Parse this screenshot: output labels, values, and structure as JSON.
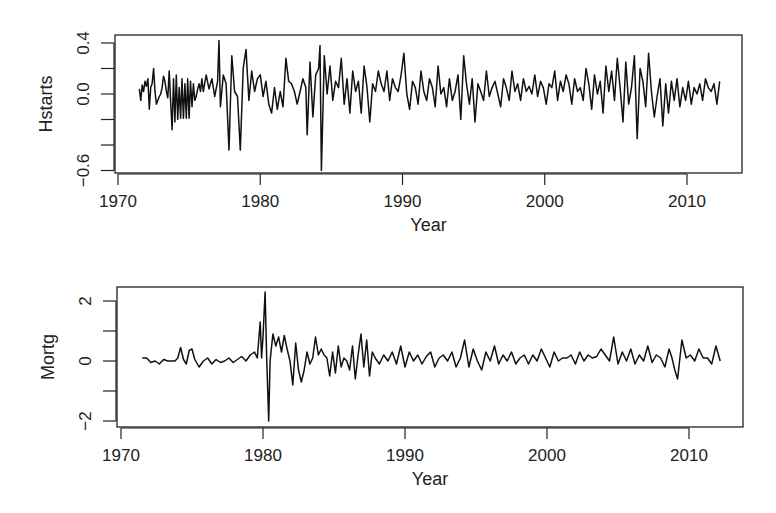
{
  "chart_data": [
    {
      "type": "line",
      "title": "",
      "xlabel": "Year",
      "ylabel": "Hstarts",
      "xlim": [
        1970,
        2013
      ],
      "ylim": [
        -0.6,
        0.4
      ],
      "x_ticks": [
        1970,
        1980,
        1990,
        2000,
        2010
      ],
      "x_tick_labels": [
        "1970",
        "1980",
        "1990",
        "2000",
        "2010"
      ],
      "y_ticks": [
        0.4,
        0.2,
        0.0,
        -0.2,
        -0.4,
        -0.6
      ],
      "y_tick_labels": [
        "0.4",
        "",
        "0.0",
        "",
        "",
        "-0.6"
      ],
      "grid": false,
      "legend": null,
      "frame": {
        "left": 115,
        "right": 742,
        "top": 35,
        "bottom": 173
      },
      "axis_px": {
        "x0": 118,
        "x1": 687,
        "xv0": 1970,
        "xv1": 2010,
        "y0": 94,
        "y1": 43,
        "yv0": 0.0,
        "yv1": 0.4
      },
      "series": [
        {
          "name": "Hstarts",
          "x": [
            1971.5,
            1971.6,
            1971.7,
            1971.8,
            1971.9,
            1972.0,
            1972.1,
            1972.2,
            1972.3,
            1972.4,
            1972.5,
            1972.6,
            1972.7,
            1972.8,
            1972.9,
            1973.0,
            1973.1,
            1973.2,
            1973.3,
            1973.4,
            1973.5,
            1973.6,
            1973.7,
            1973.8,
            1973.9,
            1974.0,
            1974.1,
            1974.2,
            1974.3,
            1974.4,
            1974.5,
            1974.6,
            1974.7,
            1974.8,
            1974.9,
            1975.0,
            1975.1,
            1975.2,
            1975.3,
            1975.4,
            1975.5,
            1975.6,
            1975.7,
            1975.8,
            1975.9,
            1976.0,
            1976.2,
            1976.4,
            1976.6,
            1976.8,
            1977.0,
            1977.1,
            1977.2,
            1977.4,
            1977.6,
            1977.8,
            1978.0,
            1978.2,
            1978.4,
            1978.6,
            1978.8,
            1979.0,
            1979.2,
            1979.4,
            1979.6,
            1979.8,
            1980.0,
            1980.2,
            1980.4,
            1980.6,
            1980.8,
            1981.0,
            1981.2,
            1981.4,
            1981.6,
            1981.8,
            1982.0,
            1982.2,
            1982.4,
            1982.6,
            1982.8,
            1983.0,
            1983.2,
            1983.3,
            1983.5,
            1983.7,
            1983.9,
            1984.1,
            1984.2,
            1984.3,
            1984.5,
            1984.7,
            1984.9,
            1985.1,
            1985.3,
            1985.5,
            1985.7,
            1985.9,
            1986.1,
            1986.3,
            1986.5,
            1986.7,
            1986.9,
            1987.1,
            1987.3,
            1987.5,
            1987.7,
            1987.9,
            1988.1,
            1988.3,
            1988.5,
            1988.7,
            1988.9,
            1989.1,
            1989.3,
            1989.5,
            1989.7,
            1989.9,
            1990.1,
            1990.3,
            1990.5,
            1990.7,
            1990.9,
            1991.1,
            1991.3,
            1991.5,
            1991.7,
            1991.9,
            1992.1,
            1992.3,
            1992.5,
            1992.7,
            1992.9,
            1993.1,
            1993.3,
            1993.5,
            1993.7,
            1993.9,
            1994.1,
            1994.3,
            1994.5,
            1994.7,
            1994.9,
            1995.1,
            1995.3,
            1995.5,
            1995.7,
            1995.9,
            1996.1,
            1996.3,
            1996.5,
            1996.7,
            1996.9,
            1997.1,
            1997.3,
            1997.5,
            1997.7,
            1997.9,
            1998.1,
            1998.3,
            1998.5,
            1998.7,
            1998.9,
            1999.1,
            1999.3,
            1999.5,
            1999.7,
            1999.9,
            2000.1,
            2000.3,
            2000.5,
            2000.7,
            2000.9,
            2001.1,
            2001.3,
            2001.5,
            2001.7,
            2001.9,
            2002.1,
            2002.3,
            2002.5,
            2002.7,
            2002.9,
            2003.1,
            2003.3,
            2003.5,
            2003.7,
            2003.9,
            2004.1,
            2004.3,
            2004.5,
            2004.7,
            2004.9,
            2005.1,
            2005.3,
            2005.5,
            2005.7,
            2005.9,
            2006.1,
            2006.3,
            2006.5,
            2006.7,
            2006.9,
            2007.1,
            2007.3,
            2007.5,
            2007.7,
            2007.9,
            2008.1,
            2008.3,
            2008.5,
            2008.7,
            2008.9,
            2009.1,
            2009.3,
            2009.5,
            2009.7,
            2009.9,
            2010.1,
            2010.3,
            2010.5,
            2010.7,
            2010.9,
            2011.1,
            2011.3,
            2011.5,
            2011.7,
            2011.9,
            2012.1,
            2012.3
          ],
          "values": [
            0.04,
            -0.05,
            0.07,
            0.02,
            0.1,
            0.06,
            0.12,
            -0.12,
            0.05,
            0.08,
            0.2,
            0.02,
            -0.08,
            -0.05,
            -0.02,
            0.0,
            0.05,
            0.14,
            0.1,
            0.02,
            -0.03,
            0.18,
            -0.05,
            -0.28,
            0.12,
            -0.22,
            0.15,
            -0.2,
            0.05,
            -0.19,
            0.12,
            -0.19,
            0.08,
            -0.19,
            0.12,
            -0.19,
            0.1,
            -0.1,
            0.08,
            -0.05,
            -0.02,
            0.04,
            0.08,
            0.02,
            0.12,
            0.02,
            0.15,
            0.04,
            0.12,
            -0.02,
            0.1,
            0.42,
            -0.1,
            0.15,
            0.08,
            -0.44,
            0.3,
            0.02,
            -0.02,
            -0.44,
            0.2,
            0.35,
            -0.05,
            0.18,
            0.02,
            0.12,
            0.15,
            -0.02,
            0.1,
            -0.08,
            -0.15,
            0.05,
            -0.12,
            0.02,
            -0.1,
            0.28,
            0.1,
            0.08,
            0.02,
            -0.08,
            0.02,
            0.12,
            0.05,
            -0.32,
            0.25,
            -0.18,
            0.15,
            0.2,
            0.38,
            -0.6,
            0.3,
            0.0,
            0.22,
            -0.05,
            0.1,
            0.05,
            0.28,
            -0.08,
            0.12,
            -0.15,
            0.18,
            0.02,
            0.1,
            -0.15,
            0.22,
            0.06,
            -0.22,
            0.08,
            0.02,
            0.18,
            0.08,
            0.02,
            0.18,
            -0.05,
            0.12,
            0.05,
            0.02,
            0.15,
            0.32,
            0.0,
            -0.12,
            0.1,
            0.05,
            -0.08,
            0.18,
            0.02,
            -0.05,
            0.12,
            0.05,
            -0.1,
            0.22,
            0.0,
            0.05,
            -0.1,
            0.12,
            -0.05,
            0.02,
            0.15,
            -0.2,
            0.3,
            0.08,
            -0.08,
            0.12,
            -0.22,
            0.08,
            0.02,
            -0.05,
            0.18,
            -0.02,
            0.05,
            0.1,
            0.0,
            -0.1,
            0.12,
            0.05,
            -0.05,
            0.18,
            0.02,
            0.08,
            -0.05,
            0.12,
            0.02,
            0.06,
            0.0,
            0.15,
            -0.02,
            0.1,
            0.05,
            -0.08,
            0.08,
            0.05,
            0.18,
            -0.05,
            0.1,
            0.02,
            0.15,
            0.08,
            -0.08,
            0.12,
            0.02,
            0.05,
            -0.05,
            0.2,
            0.08,
            -0.12,
            0.15,
            0.0,
            0.1,
            -0.15,
            0.22,
            0.02,
            0.18,
            -0.05,
            0.28,
            0.05,
            -0.22,
            0.25,
            -0.08,
            0.05,
            0.3,
            -0.35,
            0.2,
            0.1,
            -0.1,
            0.32,
            0.02,
            -0.18,
            -0.02,
            0.12,
            -0.25,
            0.08,
            -0.15,
            0.1,
            -0.05,
            0.12,
            -0.1,
            0.05,
            -0.05,
            0.1,
            -0.08,
            0.05,
            0.0,
            0.08,
            -0.05,
            0.12,
            0.05,
            0.02,
            0.08,
            -0.08,
            0.1,
            0.02,
            0.08,
            -0.1,
            0.12,
            0.05,
            0.02,
            0.1,
            0.05,
            0.02
          ]
        }
      ]
    },
    {
      "type": "line",
      "title": "",
      "xlabel": "Year",
      "ylabel": "Mortg",
      "xlim": [
        1970,
        2013
      ],
      "ylim": [
        -2,
        2
      ],
      "x_ticks": [
        1970,
        1980,
        1990,
        2000,
        2010
      ],
      "x_tick_labels": [
        "1970",
        "1980",
        "1990",
        "2000",
        "2010"
      ],
      "y_ticks": [
        2,
        1,
        0,
        -1,
        -2
      ],
      "y_tick_labels": [
        "2",
        "",
        "0",
        "",
        "-2"
      ],
      "grid": false,
      "legend": null,
      "frame": {
        "left": 117,
        "right": 743,
        "top": 287,
        "bottom": 427
      },
      "axis_px": {
        "x0": 121,
        "x1": 689,
        "xv0": 1970,
        "xv1": 2010,
        "y0": 361,
        "y1": 301,
        "yv0": 0,
        "yv1": 2
      },
      "series": [
        {
          "name": "Mortg",
          "x": [
            1971.5,
            1971.8,
            1972.1,
            1972.4,
            1972.7,
            1973.0,
            1973.3,
            1973.6,
            1973.8,
            1974.0,
            1974.2,
            1974.4,
            1974.6,
            1974.8,
            1975.0,
            1975.2,
            1975.5,
            1975.8,
            1976.1,
            1976.4,
            1976.7,
            1977.0,
            1977.3,
            1977.6,
            1977.9,
            1978.2,
            1978.5,
            1978.8,
            1979.1,
            1979.4,
            1979.6,
            1979.8,
            1979.9,
            1980.0,
            1980.15,
            1980.25,
            1980.4,
            1980.5,
            1980.7,
            1980.9,
            1981.1,
            1981.3,
            1981.5,
            1981.7,
            1981.9,
            1982.1,
            1982.3,
            1982.5,
            1982.7,
            1982.9,
            1983.1,
            1983.3,
            1983.5,
            1983.7,
            1983.9,
            1984.1,
            1984.3,
            1984.5,
            1984.7,
            1984.9,
            1985.1,
            1985.3,
            1985.5,
            1985.7,
            1985.9,
            1986.1,
            1986.3,
            1986.5,
            1986.7,
            1986.9,
            1987.1,
            1987.3,
            1987.5,
            1987.7,
            1987.9,
            1988.2,
            1988.5,
            1988.8,
            1989.1,
            1989.4,
            1989.7,
            1990.0,
            1990.3,
            1990.6,
            1990.9,
            1991.2,
            1991.5,
            1991.8,
            1992.1,
            1992.4,
            1992.7,
            1993.0,
            1993.3,
            1993.6,
            1993.9,
            1994.2,
            1994.5,
            1994.8,
            1995.1,
            1995.4,
            1995.7,
            1996.0,
            1996.3,
            1996.6,
            1996.9,
            1997.2,
            1997.5,
            1997.8,
            1998.1,
            1998.4,
            1998.7,
            1999.0,
            1999.3,
            1999.6,
            1999.9,
            2000.2,
            2000.5,
            2000.8,
            2001.1,
            2001.4,
            2001.7,
            2002.0,
            2002.3,
            2002.6,
            2002.9,
            2003.2,
            2003.5,
            2003.8,
            2004.1,
            2004.4,
            2004.7,
            2005.0,
            2005.3,
            2005.6,
            2005.9,
            2006.2,
            2006.5,
            2006.8,
            2007.1,
            2007.4,
            2007.7,
            2008.0,
            2008.3,
            2008.6,
            2008.8,
            2009.0,
            2009.2,
            2009.5,
            2009.8,
            2010.1,
            2010.4,
            2010.7,
            2011.0,
            2011.3,
            2011.6,
            2011.9,
            2012.2
          ],
          "values": [
            0.1,
            0.1,
            -0.05,
            0.0,
            -0.1,
            0.05,
            0.0,
            0.0,
            0.0,
            0.1,
            0.45,
            0.05,
            -0.1,
            0.35,
            0.4,
            0.05,
            -0.2,
            0.0,
            0.1,
            -0.1,
            0.05,
            -0.05,
            0.0,
            0.1,
            -0.05,
            0.05,
            0.15,
            0.0,
            0.2,
            0.3,
            0.1,
            1.3,
            0.1,
            0.8,
            2.3,
            0.2,
            -2.0,
            0.0,
            0.9,
            0.5,
            0.8,
            0.3,
            0.85,
            0.4,
            0.0,
            -0.8,
            0.6,
            -0.3,
            -0.7,
            -0.3,
            0.3,
            -0.1,
            0.1,
            0.8,
            0.2,
            0.4,
            0.2,
            0.1,
            -0.5,
            0.3,
            -0.4,
            0.5,
            -0.2,
            0.1,
            0.0,
            -0.3,
            0.5,
            -0.6,
            0.2,
            0.9,
            -0.2,
            0.7,
            -0.5,
            0.3,
            0.1,
            -0.1,
            0.2,
            0.0,
            0.3,
            -0.1,
            0.5,
            -0.2,
            0.3,
            0.0,
            0.2,
            -0.1,
            0.15,
            0.3,
            -0.2,
            0.1,
            0.2,
            0.0,
            0.3,
            -0.2,
            0.1,
            0.7,
            -0.2,
            0.4,
            0.0,
            -0.3,
            0.3,
            0.0,
            0.5,
            -0.1,
            0.2,
            0.0,
            0.3,
            -0.1,
            0.1,
            0.2,
            -0.1,
            0.2,
            0.0,
            0.4,
            0.1,
            -0.2,
            0.3,
            0.0,
            0.1,
            0.1,
            0.2,
            -0.1,
            0.3,
            0.0,
            0.2,
            0.1,
            0.15,
            0.4,
            0.2,
            0.0,
            0.8,
            -0.1,
            0.3,
            0.0,
            0.4,
            -0.1,
            0.2,
            0.0,
            0.5,
            -0.05,
            0.2,
            0.1,
            -0.2,
            0.4,
            0.1,
            -0.3,
            -0.6,
            0.7,
            0.1,
            0.2,
            0.0,
            0.4,
            0.1,
            0.1,
            -0.1,
            0.5,
            0.0,
            0.2,
            0.25
          ]
        }
      ]
    }
  ]
}
